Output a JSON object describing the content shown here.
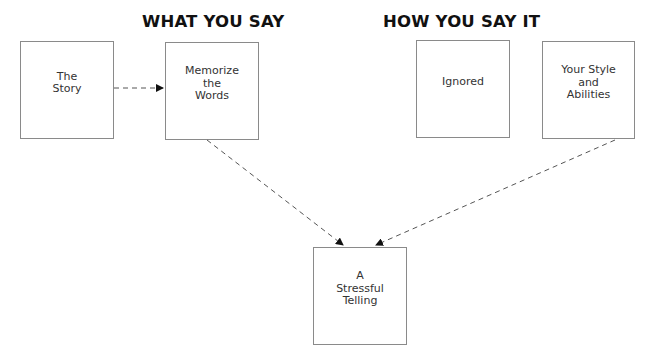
{
  "headings": {
    "what": "WHAT YOU SAY",
    "how": "HOW YOU SAY IT"
  },
  "boxes": {
    "story": "The\nStory",
    "memorize": "Memorize\nthe\nWords",
    "ignored": "Ignored",
    "style": "Your Style\nand\nAbilities",
    "result": "A\nStressful\nTelling"
  },
  "connectors": [
    {
      "from": "The Story",
      "to": "Memorize the Words",
      "style": "dashed-arrow"
    },
    {
      "from": "Memorize the Words",
      "to": "A Stressful Telling",
      "style": "dashed-arrow"
    },
    {
      "from": "Your Style and Abilities",
      "to": "A Stressful Telling",
      "style": "dashed-arrow"
    }
  ],
  "colors": {
    "line": "#555555",
    "border": "#8a8a8a",
    "text": "#333333"
  }
}
